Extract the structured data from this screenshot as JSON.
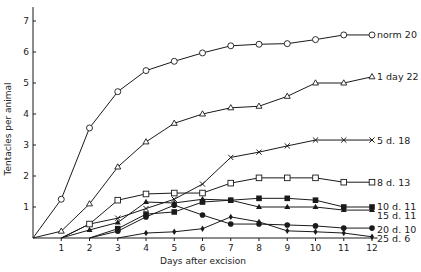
{
  "chart_data": {
    "type": "line",
    "title": "",
    "xlabel": "Days after excision",
    "ylabel": "Tentacles per animal",
    "xlim": [
      0,
      12
    ],
    "ylim": [
      0,
      7.5
    ],
    "x_ticks": [
      1,
      2,
      3,
      4,
      5,
      6,
      7,
      8,
      9,
      10,
      11,
      12
    ],
    "y_ticks": [
      1,
      2,
      3,
      4,
      5,
      6,
      7
    ],
    "grid": false,
    "legend_position": "inline-right",
    "series": [
      {
        "name": "norm 20",
        "marker": "open-circle",
        "x": [
          0,
          1,
          2,
          3,
          4,
          5,
          6,
          7,
          8,
          9,
          10,
          11,
          12
        ],
        "values": [
          0,
          1.25,
          3.55,
          4.72,
          5.4,
          5.7,
          5.97,
          6.2,
          6.25,
          6.27,
          6.4,
          6.55,
          6.55
        ]
      },
      {
        "name": "1 day 22",
        "marker": "open-triangle",
        "x": [
          0,
          1,
          2,
          3,
          4,
          5,
          6,
          7,
          8,
          9,
          10,
          11,
          12
        ],
        "values": [
          0,
          0.22,
          1.1,
          2.29,
          3.1,
          3.7,
          4.0,
          4.2,
          4.25,
          4.57,
          5.0,
          5.0,
          5.2
        ]
      },
      {
        "name": "5 d. 18",
        "marker": "cross",
        "x": [
          1,
          2,
          3,
          4,
          5,
          6,
          7,
          8,
          9,
          10,
          11,
          12
        ],
        "values": [
          0,
          0.45,
          0.64,
          0.95,
          1.25,
          1.74,
          2.6,
          2.77,
          2.97,
          3.16,
          3.16,
          3.16
        ]
      },
      {
        "name": "8 d. 13",
        "marker": "open-square",
        "x": [
          1,
          2,
          3,
          4,
          5,
          6,
          7,
          8,
          9,
          10,
          11,
          12
        ],
        "values": [
          0,
          0.45,
          1.22,
          1.42,
          1.45,
          1.45,
          1.77,
          1.94,
          1.94,
          1.94,
          1.8,
          1.8
        ]
      },
      {
        "name": "10 d. 11",
        "marker": "filled-square",
        "x": [
          2,
          3,
          4,
          5,
          6,
          7,
          8,
          9,
          10,
          11,
          12
        ],
        "values": [
          0,
          0.3,
          0.77,
          0.84,
          1.16,
          1.22,
          1.28,
          1.28,
          1.22,
          1.0,
          1.0
        ]
      },
      {
        "name": "15 d. 11",
        "marker": "filled-triangle",
        "x": [
          1,
          2,
          3,
          4,
          5,
          6,
          7,
          8,
          9,
          10,
          11,
          12
        ],
        "values": [
          0,
          0.26,
          0.5,
          1.16,
          1.13,
          1.25,
          1.22,
          1.0,
          1.0,
          1.0,
          0.9,
          0.9
        ]
      },
      {
        "name": "20 d. 10",
        "marker": "filled-circle",
        "x": [
          2,
          3,
          4,
          5,
          6,
          7,
          8,
          9,
          10,
          11,
          12
        ],
        "values": [
          0,
          0.22,
          0.68,
          1.06,
          0.74,
          0.45,
          0.45,
          0.42,
          0.39,
          0.32,
          0.32
        ]
      },
      {
        "name": "25 d. 6",
        "marker": "filled-diamond",
        "x": [
          3,
          4,
          5,
          6,
          7,
          8,
          9,
          10,
          11,
          12
        ],
        "values": [
          0,
          0.16,
          0.2,
          0.3,
          0.68,
          0.52,
          0.23,
          0.2,
          0.16,
          0.04
        ]
      }
    ]
  },
  "labels": {
    "xlabel": "Days after excision",
    "ylabel": "Tentacles per animal"
  }
}
